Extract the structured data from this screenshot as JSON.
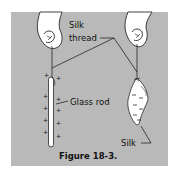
{
  "figure": {
    "caption": "Figure 18-3.",
    "labels": {
      "silk_thread_line1": "Silk",
      "silk_thread_line2": "thread",
      "glass_rod": "Glass rod",
      "silk": "Silk"
    },
    "charges": {
      "glass_rod": "+",
      "silk": "−"
    },
    "colors": {
      "panel": "#b9b9b9",
      "ink": "#111111",
      "object_fill": "#ffffff"
    }
  }
}
